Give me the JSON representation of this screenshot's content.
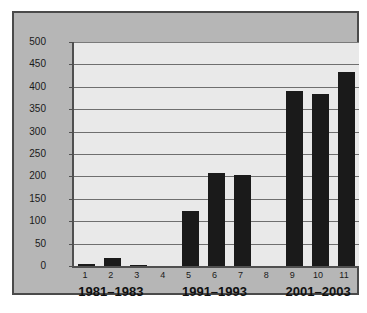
{
  "chart_data": {
    "type": "bar",
    "title": "",
    "subtitle": "",
    "xlabel": "",
    "ylabel": "",
    "categories": [
      "1",
      "2",
      "3",
      "4",
      "5",
      "6",
      "7",
      "8",
      "9",
      "10",
      "11"
    ],
    "values": [
      5,
      17,
      3,
      0,
      122,
      208,
      203,
      0,
      390,
      383,
      434
    ],
    "ylim": [
      0,
      500
    ],
    "yticks": [
      0,
      50,
      100,
      150,
      200,
      250,
      300,
      350,
      400,
      450,
      500
    ],
    "ytick_labels": [
      "0",
      "50",
      "100",
      "150",
      "200",
      "250",
      "300",
      "350",
      "400",
      "450",
      "500"
    ],
    "grid": true,
    "grid_axis": "y",
    "legend": null,
    "bar_color": "#1a1a1a",
    "plot_background": "#e9e9e9",
    "panel_background": "#b6b6b6",
    "group_labels": [
      {
        "text": "1981–1983",
        "spans": [
          "1",
          "2",
          "3"
        ]
      },
      {
        "text": "1991–1993",
        "spans": [
          "5",
          "6",
          "7"
        ]
      },
      {
        "text": "2001–2003",
        "spans": [
          "9",
          "10",
          "11"
        ]
      }
    ],
    "annotations": []
  }
}
